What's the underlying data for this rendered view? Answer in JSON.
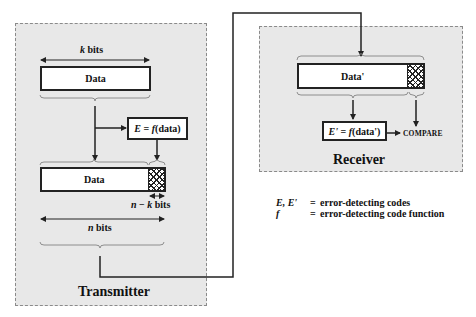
{
  "transmitter": {
    "title": "Transmitter",
    "k_bits_label_var": "k",
    "k_bits_label_unit": " bits",
    "data_top_label": "Data",
    "ecode_var": "E",
    "ecode_eq": " = ",
    "ecode_fn": "f",
    "ecode_arg": "(data)",
    "data_bottom_label": "Data",
    "nk_bits_var_n": "n",
    "nk_bits_minus": " − ",
    "nk_bits_var_k": "k",
    "nk_bits_unit": " bits",
    "n_bits_var": "n",
    "n_bits_unit": " bits"
  },
  "receiver": {
    "title": "Receiver",
    "data_label": "Data'",
    "ecode_var": "E'",
    "ecode_eq": " = ",
    "ecode_fn": "f",
    "ecode_arg": "(data')",
    "compare_label": "COMPARE"
  },
  "legend": {
    "items": [
      {
        "symbol": "E, E'",
        "eq": "=",
        "text": "error-detecting codes"
      },
      {
        "symbol": "f",
        "eq": "=",
        "text": "error-detecting code function"
      }
    ]
  },
  "colors": {
    "panel_fill": "#e8e8e8",
    "panel_border": "#8a8a8a",
    "line": "#222222"
  }
}
